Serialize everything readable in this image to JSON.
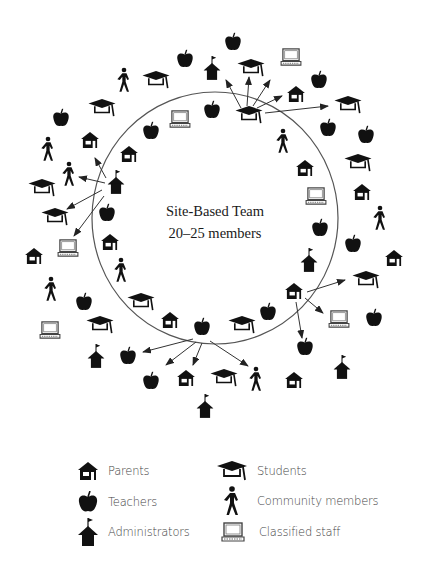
{
  "diagram": {
    "center_label": {
      "line1": "Site-Based Team",
      "line2": "20–25 members"
    },
    "circle": {
      "cx": 215,
      "cy": 218,
      "rx": 123,
      "ry": 126,
      "stroke": "#555555"
    },
    "icon_color": "#111111",
    "icons": [
      {
        "type": "teacher",
        "x": 233,
        "y": 42
      },
      {
        "type": "student",
        "x": 156,
        "y": 80
      },
      {
        "type": "community",
        "x": 124,
        "y": 80
      },
      {
        "type": "admin",
        "x": 212,
        "y": 68
      },
      {
        "type": "student",
        "x": 251,
        "y": 68
      },
      {
        "type": "classified",
        "x": 291,
        "y": 57
      },
      {
        "type": "teacher",
        "x": 185,
        "y": 59
      },
      {
        "type": "student",
        "x": 102,
        "y": 108
      },
      {
        "type": "teacher",
        "x": 61,
        "y": 118
      },
      {
        "type": "parent",
        "x": 90,
        "y": 140
      },
      {
        "type": "classified",
        "x": 180,
        "y": 119
      },
      {
        "type": "teacher",
        "x": 212,
        "y": 110
      },
      {
        "type": "teacher",
        "x": 151,
        "y": 131
      },
      {
        "type": "parent",
        "x": 129,
        "y": 154
      },
      {
        "type": "community",
        "x": 48,
        "y": 149
      },
      {
        "type": "community",
        "x": 69,
        "y": 174
      },
      {
        "type": "admin",
        "x": 116,
        "y": 182
      },
      {
        "type": "student",
        "x": 42,
        "y": 188
      },
      {
        "type": "student",
        "x": 55,
        "y": 217
      },
      {
        "type": "teacher",
        "x": 107,
        "y": 213
      },
      {
        "type": "parent",
        "x": 110,
        "y": 242
      },
      {
        "type": "classified",
        "x": 68,
        "y": 248
      },
      {
        "type": "parent",
        "x": 34,
        "y": 256
      },
      {
        "type": "community",
        "x": 121,
        "y": 270
      },
      {
        "type": "community",
        "x": 51,
        "y": 289
      },
      {
        "type": "teacher",
        "x": 84,
        "y": 302
      },
      {
        "type": "student",
        "x": 141,
        "y": 302
      },
      {
        "type": "parent",
        "x": 170,
        "y": 320
      },
      {
        "type": "classified",
        "x": 50,
        "y": 330
      },
      {
        "type": "student",
        "x": 100,
        "y": 325
      },
      {
        "type": "teacher",
        "x": 202,
        "y": 327
      },
      {
        "type": "student",
        "x": 242,
        "y": 325
      },
      {
        "type": "teacher",
        "x": 268,
        "y": 312
      },
      {
        "type": "admin",
        "x": 96,
        "y": 356
      },
      {
        "type": "teacher",
        "x": 128,
        "y": 356
      },
      {
        "type": "student",
        "x": 249,
        "y": 115
      },
      {
        "type": "parent",
        "x": 296,
        "y": 94
      },
      {
        "type": "teacher",
        "x": 319,
        "y": 80
      },
      {
        "type": "student",
        "x": 348,
        "y": 105
      },
      {
        "type": "teacher",
        "x": 328,
        "y": 128
      },
      {
        "type": "teacher",
        "x": 366,
        "y": 135
      },
      {
        "type": "community",
        "x": 283,
        "y": 141
      },
      {
        "type": "student",
        "x": 358,
        "y": 163
      },
      {
        "type": "parent",
        "x": 305,
        "y": 168
      },
      {
        "type": "parent",
        "x": 362,
        "y": 192
      },
      {
        "type": "classified",
        "x": 316,
        "y": 196
      },
      {
        "type": "community",
        "x": 380,
        "y": 218
      },
      {
        "type": "teacher",
        "x": 320,
        "y": 228
      },
      {
        "type": "teacher",
        "x": 353,
        "y": 244
      },
      {
        "type": "parent",
        "x": 394,
        "y": 258
      },
      {
        "type": "admin",
        "x": 309,
        "y": 260
      },
      {
        "type": "student",
        "x": 366,
        "y": 280
      },
      {
        "type": "parent",
        "x": 294,
        "y": 291
      },
      {
        "type": "classified",
        "x": 339,
        "y": 319
      },
      {
        "type": "teacher",
        "x": 374,
        "y": 318
      },
      {
        "type": "teacher",
        "x": 305,
        "y": 347
      },
      {
        "type": "admin",
        "x": 342,
        "y": 367
      },
      {
        "type": "teacher",
        "x": 151,
        "y": 381
      },
      {
        "type": "parent",
        "x": 186,
        "y": 378
      },
      {
        "type": "student",
        "x": 224,
        "y": 378
      },
      {
        "type": "community",
        "x": 256,
        "y": 379
      },
      {
        "type": "parent",
        "x": 294,
        "y": 380
      },
      {
        "type": "admin",
        "x": 205,
        "y": 406
      }
    ],
    "arrows": [
      {
        "x1": 241,
        "y1": 108,
        "x2": 226,
        "y2": 80
      },
      {
        "x1": 247,
        "y1": 106,
        "x2": 249,
        "y2": 77
      },
      {
        "x1": 253,
        "y1": 106,
        "x2": 270,
        "y2": 80
      },
      {
        "x1": 257,
        "y1": 108,
        "x2": 282,
        "y2": 96
      },
      {
        "x1": 265,
        "y1": 113,
        "x2": 328,
        "y2": 106
      },
      {
        "x1": 106,
        "y1": 178,
        "x2": 95,
        "y2": 158
      },
      {
        "x1": 105,
        "y1": 183,
        "x2": 79,
        "y2": 177
      },
      {
        "x1": 102,
        "y1": 190,
        "x2": 67,
        "y2": 209
      },
      {
        "x1": 104,
        "y1": 196,
        "x2": 74,
        "y2": 236
      },
      {
        "x1": 307,
        "y1": 292,
        "x2": 345,
        "y2": 280
      },
      {
        "x1": 305,
        "y1": 298,
        "x2": 323,
        "y2": 313
      },
      {
        "x1": 296,
        "y1": 302,
        "x2": 302,
        "y2": 338
      },
      {
        "x1": 193,
        "y1": 339,
        "x2": 143,
        "y2": 352
      },
      {
        "x1": 196,
        "y1": 342,
        "x2": 166,
        "y2": 365
      },
      {
        "x1": 202,
        "y1": 343,
        "x2": 193,
        "y2": 365
      },
      {
        "x1": 210,
        "y1": 341,
        "x2": 248,
        "y2": 366
      }
    ]
  },
  "legend": {
    "items": [
      {
        "type": "parent",
        "label": "Parents"
      },
      {
        "type": "teacher",
        "label": "Teachers"
      },
      {
        "type": "admin",
        "label": "Administrators"
      },
      {
        "type": "student",
        "label": "Students"
      },
      {
        "type": "community",
        "label": "Community members"
      },
      {
        "type": "classified",
        "label": "Classified staff"
      }
    ]
  }
}
